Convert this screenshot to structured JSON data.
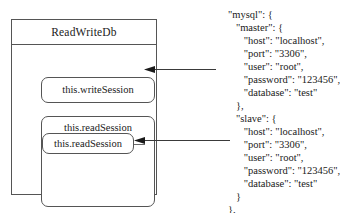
{
  "diagram": {
    "class_box": {
      "title": "ReadWriteDb",
      "write_session": {
        "label": "this.writeSession"
      },
      "read_session": {
        "label": "this.readSession",
        "inner_label": "this.readSession"
      }
    },
    "arrows": [
      {
        "name": "arrow-to-write-session",
        "direction": "left"
      },
      {
        "name": "arrow-to-read-session",
        "direction": "left"
      }
    ],
    "stroke_color": "#555555"
  },
  "code": {
    "lines": [
      "\"mysql\": {",
      "   \"master\": {",
      "      \"host\": \"localhost\",",
      "      \"port\": \"3306\",",
      "      \"user\": \"root\",",
      "      \"password\": \"123456\",",
      "      \"database\": \"test\"",
      "   },",
      "   \"slave\": {",
      "      \"host\": \"localhost\",",
      "      \"port\": \"3306\",",
      "      \"user\": \"root\",",
      "      \"password\": \"123456\",",
      "      \"database\": \"test\"",
      "   }",
      "},"
    ]
  }
}
